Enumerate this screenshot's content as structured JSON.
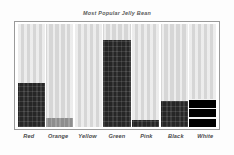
{
  "chart_data": {
    "type": "bar",
    "title": "Most Popular Jelly Bean",
    "xlabel": "",
    "ylabel": "",
    "categories": [
      "Red",
      "Orange",
      "Yellow",
      "Green",
      "Pink",
      "Black",
      "White"
    ],
    "values": [
      43,
      9,
      0,
      84,
      7,
      25,
      27
    ],
    "ylim": [
      0,
      100
    ],
    "grid": false,
    "legend": null,
    "style": "grayscale-dithered",
    "bar_textures": [
      "dark",
      "mid",
      "none",
      "dark",
      "dark",
      "dark",
      "banded"
    ],
    "colors": {
      "background": "#fdfdfd",
      "plot_background": "#d6d6d6",
      "frame": "#9a9a9a",
      "bar_dark": "#262626",
      "bar_mid": "#8e8e8e",
      "bar_none": "#c9c9c9",
      "bar_banded": "#000000",
      "title_text": "#5a5a5a",
      "label_text": "#4a4a4a"
    }
  }
}
